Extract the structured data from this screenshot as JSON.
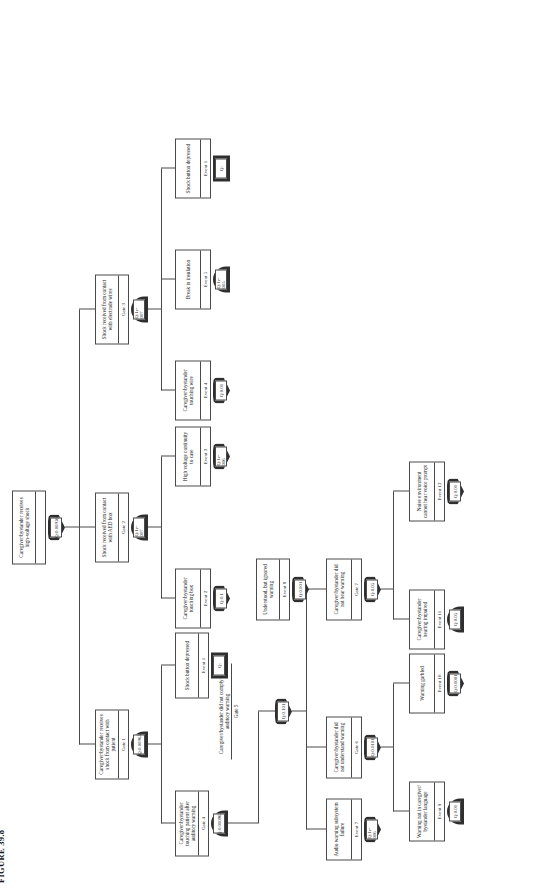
{
  "figure": {
    "caption": "FIGURE 39.8"
  },
  "tree": {
    "root": {
      "desc": "Caregiver/bystander receives high-voltage shock",
      "id": "",
      "gate_type": "or-gate",
      "q": "Q:0.00956"
    },
    "gate1": {
      "desc": "Caregiver/bystander receives shock from contact with patient",
      "id": "Gate 1",
      "gate_type": "and-gate",
      "q": "Q:0.00965"
    },
    "gate2": {
      "desc": "Shock received from contact with AED box",
      "id": "Gate 2",
      "gate_type": "and-gate",
      "q": "Q:1e-007"
    },
    "gate3": {
      "desc": "Shock received from contact with electrode wires",
      "id": "Gate 3",
      "gate_type": "and-gate",
      "q": "Q:1e-007"
    },
    "gate4": {
      "desc": "Caregiver/bystander touching patient after auditory warning",
      "id": "Gate 4",
      "gate_type": "and-gate",
      "q": "Q:0.000965"
    },
    "gate5": {
      "desc": "Caregiver/bystander did not comply with auditory warning",
      "id": "Gate 5",
      "gate_type": "or-gate",
      "q": "Q:0.101"
    },
    "gate6": {
      "desc": "Caregiver/bystander did not understand warning",
      "id": "Gate 6",
      "gate_type": "or-gate",
      "q": "Q:0.0101"
    },
    "gate7": {
      "desc": "Caregiver/bystander did not hear warning",
      "id": "Gate 7",
      "gate_type": "or-gate",
      "q": "Q:0.05"
    },
    "event1a": {
      "desc": "Shock button depressed",
      "id": "Event 1",
      "gate_type": "block-event",
      "q": "Q:"
    },
    "event1b": {
      "desc": "Shock button depressed",
      "id": "Event 1",
      "gate_type": "block-event",
      "q": "Q:"
    },
    "event2": {
      "desc": "Caregiver/bystander touching box",
      "id": "Event 2",
      "gate_type": "or-event",
      "q": "Q:0.1"
    },
    "event3": {
      "desc": "High voltage continuity to case",
      "id": "Event 3",
      "gate_type": "or-event",
      "q": "Q:1e-006"
    },
    "event4": {
      "desc": "Caregiver/bystander touching wire",
      "id": "Event 4",
      "gate_type": "or-event",
      "q": "Q:0.01"
    },
    "event5": {
      "desc": "Break in insulation",
      "id": "Event 5",
      "gate_type": "and-event",
      "q": "Q:1e-005"
    },
    "event7": {
      "desc": "Audio warning subsystem failure",
      "id": "Event 7",
      "gate_type": "or-event",
      "q": "Q:1e-006"
    },
    "event8": {
      "desc": "Understood, but ignored warning",
      "id": "Event 8",
      "gate_type": "or-event",
      "q": "Q:0.001"
    },
    "event9": {
      "desc": "Warning not in caregiver/ bystander language",
      "id": "Event 9",
      "gate_type": "and-event",
      "q": "Q:0.01"
    },
    "event10": {
      "desc": "Warning garbled",
      "id": "Event 10",
      "gate_type": "or-event",
      "q": "Q:0.0001"
    },
    "event11": {
      "desc": "Caregiver/bystander hearing impaired",
      "id": "Event 11",
      "gate_type": "and-event",
      "q": "Q:0.05"
    },
    "event12": {
      "desc": "Noise environment cannot hear voice prompt",
      "id": "Event 12",
      "gate_type": "or-event",
      "q": "Q:0.01"
    }
  }
}
